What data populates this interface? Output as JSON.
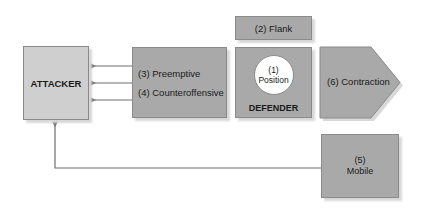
{
  "diagram": {
    "nodes": {
      "attacker": {
        "label": "ATTACKER"
      },
      "preemptive": {
        "label": "(3) Preemptive"
      },
      "counteroffensive": {
        "label": "(4) Counteroffensive"
      },
      "flank": {
        "label": "(2) Flank"
      },
      "position": {
        "number": "(1)",
        "label": "Position"
      },
      "defender": {
        "label": "DEFENDER"
      },
      "contraction": {
        "label": "(6) Contraction"
      },
      "mobile": {
        "number": "(5)",
        "label": "Mobile"
      }
    },
    "edges": [
      {
        "from": "counteroffensive-box",
        "to": "attacker",
        "style": "arrow"
      },
      {
        "from": "counteroffensive-box",
        "to": "attacker",
        "style": "arrow"
      },
      {
        "from": "counteroffensive-box",
        "to": "attacker",
        "style": "arrow"
      },
      {
        "from": "mobile",
        "to": "attacker",
        "style": "elbow-arrow"
      }
    ],
    "colors": {
      "attacker_fill": "#cfcfcf",
      "box_fill": "#a9a9a9",
      "border": "#8a8a8a",
      "line": "#6e6e6e"
    }
  }
}
